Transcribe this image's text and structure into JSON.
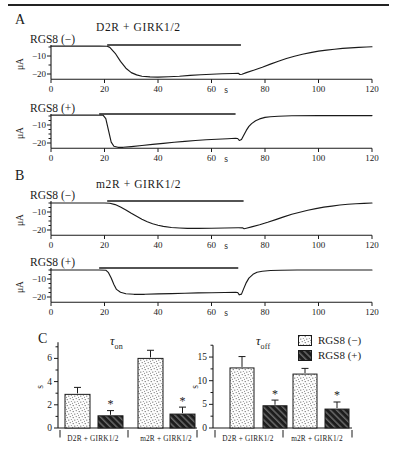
{
  "page": {
    "background": "#ffffff",
    "ink": "#1a1a1a"
  },
  "figure": {
    "panels": {
      "a": {
        "label": "A",
        "title": "D2R + GIRK1/2"
      },
      "b": {
        "label": "B",
        "title": "m2R + GIRK1/2"
      },
      "c": {
        "label": "C"
      }
    },
    "legend": {
      "items": [
        {
          "label": "RGS8 (−)",
          "pattern": "stipple"
        },
        {
          "label": "RGS8 (+)",
          "pattern": "dark-hatch"
        }
      ]
    }
  },
  "chart_data": [
    {
      "id": "trace-a-minus",
      "type": "line",
      "panel": "A",
      "condition": "D2R + GIRK1/2",
      "trace_label": "RGS8 (−)",
      "ylabel": "μA",
      "xlabel": "s",
      "xlim": [
        0,
        120
      ],
      "x_ticks": [
        0,
        20,
        40,
        60,
        80,
        100,
        120
      ],
      "y_tick_labels": [
        "−10",
        "−20"
      ],
      "y_tick_values": [
        -10,
        -20
      ],
      "y_minor_step": 5,
      "agonist_bar_s": [
        21,
        71
      ],
      "points": [
        [
          0,
          -4.5
        ],
        [
          18,
          -4.5
        ],
        [
          21,
          -4.6
        ],
        [
          22,
          -5.2
        ],
        [
          24,
          -8.5
        ],
        [
          26,
          -13
        ],
        [
          28,
          -16.8
        ],
        [
          30,
          -19.2
        ],
        [
          32,
          -20.5
        ],
        [
          34,
          -21.2
        ],
        [
          37,
          -21.6
        ],
        [
          40,
          -21.7
        ],
        [
          44,
          -21.5
        ],
        [
          48,
          -21.2
        ],
        [
          52,
          -20.8
        ],
        [
          56,
          -20.4
        ],
        [
          60,
          -20.1
        ],
        [
          64,
          -19.9
        ],
        [
          68,
          -19.7
        ],
        [
          70,
          -19.6
        ],
        [
          70.6,
          -20.3
        ],
        [
          71.4,
          -20.1
        ],
        [
          73,
          -19.2
        ],
        [
          76,
          -17.8
        ],
        [
          79,
          -16.2
        ],
        [
          82,
          -14.5
        ],
        [
          85,
          -12.9
        ],
        [
          88,
          -11.4
        ],
        [
          91,
          -10.1
        ],
        [
          94,
          -9.0
        ],
        [
          97,
          -8.1
        ],
        [
          100,
          -7.3
        ],
        [
          103,
          -6.7
        ],
        [
          106,
          -6.2
        ],
        [
          109,
          -5.8
        ],
        [
          112,
          -5.5
        ],
        [
          115,
          -5.2
        ],
        [
          118,
          -5.0
        ],
        [
          120,
          -4.9
        ]
      ]
    },
    {
      "id": "trace-a-plus",
      "type": "line",
      "panel": "A",
      "condition": "D2R + GIRK1/2",
      "trace_label": "RGS8 (+)",
      "ylabel": "μA",
      "xlabel": "s",
      "xlim": [
        0,
        120
      ],
      "x_ticks": [
        0,
        20,
        40,
        60,
        80,
        100,
        120
      ],
      "y_tick_labels": [
        "−10",
        "−20"
      ],
      "y_tick_values": [
        -10,
        -20
      ],
      "y_minor_step": 2.5,
      "agonist_bar_s": [
        18,
        69
      ],
      "points": [
        [
          0,
          -4.5
        ],
        [
          17,
          -4.5
        ],
        [
          19.5,
          -4.6
        ],
        [
          20.5,
          -6.5
        ],
        [
          21.5,
          -13
        ],
        [
          22.5,
          -19.5
        ],
        [
          23.5,
          -21.8
        ],
        [
          25,
          -22.4
        ],
        [
          27,
          -22.4
        ],
        [
          30,
          -22.0
        ],
        [
          34,
          -21.4
        ],
        [
          38,
          -20.8
        ],
        [
          42,
          -20.2
        ],
        [
          46,
          -19.6
        ],
        [
          50,
          -19.1
        ],
        [
          54,
          -18.6
        ],
        [
          58,
          -18.2
        ],
        [
          62,
          -17.9
        ],
        [
          66,
          -17.6
        ],
        [
          69,
          -17.4
        ],
        [
          69.8,
          -17.5
        ],
        [
          70.4,
          -18.6
        ],
        [
          71.2,
          -18.0
        ],
        [
          72,
          -15.8
        ],
        [
          73,
          -13.0
        ],
        [
          74,
          -10.8
        ],
        [
          75,
          -9.2
        ],
        [
          76.5,
          -7.6
        ],
        [
          78,
          -6.6
        ],
        [
          80,
          -5.8
        ],
        [
          82,
          -5.4
        ],
        [
          85,
          -5.1
        ],
        [
          90,
          -4.9
        ],
        [
          100,
          -4.8
        ],
        [
          110,
          -4.8
        ],
        [
          120,
          -4.8
        ]
      ]
    },
    {
      "id": "trace-b-minus",
      "type": "line",
      "panel": "B",
      "condition": "m2R + GIRK1/2",
      "trace_label": "RGS8 (−)",
      "ylabel": "μA",
      "xlabel": "s",
      "xlim": [
        0,
        120
      ],
      "x_ticks": [
        0,
        20,
        40,
        60,
        80,
        100,
        120
      ],
      "y_tick_labels": [
        "−10",
        "−20"
      ],
      "y_tick_values": [
        -10,
        -20
      ],
      "y_minor_step": 2.5,
      "agonist_bar_s": [
        21,
        72
      ],
      "points": [
        [
          0,
          -5
        ],
        [
          20,
          -5
        ],
        [
          22,
          -5.1
        ],
        [
          24,
          -5.9
        ],
        [
          26,
          -7.2
        ],
        [
          28,
          -8.9
        ],
        [
          30,
          -10.7
        ],
        [
          32,
          -12.4
        ],
        [
          34,
          -14.0
        ],
        [
          36,
          -15.4
        ],
        [
          38,
          -16.5
        ],
        [
          40,
          -17.4
        ],
        [
          42,
          -18.0
        ],
        [
          45,
          -18.6
        ],
        [
          48,
          -18.9
        ],
        [
          51,
          -19.1
        ],
        [
          55,
          -19.1
        ],
        [
          60,
          -19.0
        ],
        [
          65,
          -18.9
        ],
        [
          70,
          -18.8
        ],
        [
          71.6,
          -18.8
        ],
        [
          72.2,
          -19.3
        ],
        [
          73,
          -19.0
        ],
        [
          75,
          -18.3
        ],
        [
          78,
          -17.1
        ],
        [
          81,
          -15.7
        ],
        [
          84,
          -14.2
        ],
        [
          87,
          -12.7
        ],
        [
          90,
          -11.3
        ],
        [
          93,
          -10.1
        ],
        [
          96,
          -9.0
        ],
        [
          99,
          -8.1
        ],
        [
          102,
          -7.3
        ],
        [
          105,
          -6.7
        ],
        [
          108,
          -6.1
        ],
        [
          111,
          -5.7
        ],
        [
          114,
          -5.4
        ],
        [
          117,
          -5.2
        ],
        [
          120,
          -5.0
        ]
      ]
    },
    {
      "id": "trace-b-plus",
      "type": "line",
      "panel": "B",
      "condition": "m2R + GIRK1/2",
      "trace_label": "RGS8 (+)",
      "ylabel": "μA",
      "xlabel": "s",
      "xlim": [
        0,
        120
      ],
      "x_ticks": [
        0,
        20,
        40,
        60,
        80,
        100,
        120
      ],
      "y_tick_labels": [
        "−10",
        "−20"
      ],
      "y_tick_values": [
        -10,
        -20
      ],
      "y_minor_step": 2.5,
      "agonist_bar_s": [
        18,
        70
      ],
      "points": [
        [
          0,
          -5
        ],
        [
          18,
          -5
        ],
        [
          20.5,
          -5.1
        ],
        [
          21.5,
          -6.5
        ],
        [
          22.5,
          -9.5
        ],
        [
          23.5,
          -13
        ],
        [
          24.5,
          -15.8
        ],
        [
          26,
          -17.4
        ],
        [
          28,
          -18.2
        ],
        [
          31,
          -18.5
        ],
        [
          35,
          -18.5
        ],
        [
          40,
          -18.3
        ],
        [
          45,
          -18.1
        ],
        [
          50,
          -17.9
        ],
        [
          55,
          -17.7
        ],
        [
          60,
          -17.6
        ],
        [
          65,
          -17.5
        ],
        [
          69,
          -17.4
        ],
        [
          69.8,
          -17.5
        ],
        [
          70.4,
          -18.8
        ],
        [
          71.2,
          -18.4
        ],
        [
          72,
          -15.5
        ],
        [
          73,
          -12
        ],
        [
          74,
          -9.5
        ],
        [
          75.5,
          -7.4
        ],
        [
          77,
          -6.3
        ],
        [
          79,
          -5.7
        ],
        [
          82,
          -5.3
        ],
        [
          86,
          -5.1
        ],
        [
          92,
          -5.0
        ],
        [
          100,
          -5.0
        ],
        [
          110,
          -5.0
        ],
        [
          120,
          -5.0
        ]
      ]
    },
    {
      "id": "tau-on",
      "type": "bar",
      "title": "τ",
      "title_sub": "on",
      "ylabel": "s",
      "yticks": [
        0,
        2,
        4,
        6
      ],
      "ylim": [
        0,
        7.4
      ],
      "categories": [
        "D2R + GIRK1/2",
        "m2R + GIRK1/2"
      ],
      "series": [
        {
          "name": "RGS8 (−)",
          "pattern": "stipple",
          "values": [
            2.9,
            6.0
          ],
          "errors": [
            0.6,
            0.7
          ],
          "sig": [
            "",
            ""
          ]
        },
        {
          "name": "RGS8 (+)",
          "pattern": "dark-hatch",
          "values": [
            1.05,
            1.2
          ],
          "errors": [
            0.45,
            0.6
          ],
          "sig": [
            "*",
            "*"
          ]
        }
      ]
    },
    {
      "id": "tau-off",
      "type": "bar",
      "title": "τ",
      "title_sub": "off",
      "ylabel": "s",
      "yticks": [
        0,
        5,
        10,
        15
      ],
      "ylim": [
        0,
        17.5
      ],
      "categories": [
        "D2R + GIRK1/2",
        "m2R + GIRK1/2"
      ],
      "series": [
        {
          "name": "RGS8 (−)",
          "pattern": "stipple",
          "values": [
            12.7,
            11.4
          ],
          "errors": [
            2.4,
            1.2
          ],
          "sig": [
            "",
            ""
          ]
        },
        {
          "name": "RGS8 (+)",
          "pattern": "dark-hatch",
          "values": [
            4.7,
            4.0
          ],
          "errors": [
            1.2,
            1.5
          ],
          "sig": [
            "*",
            "*"
          ]
        }
      ]
    }
  ]
}
